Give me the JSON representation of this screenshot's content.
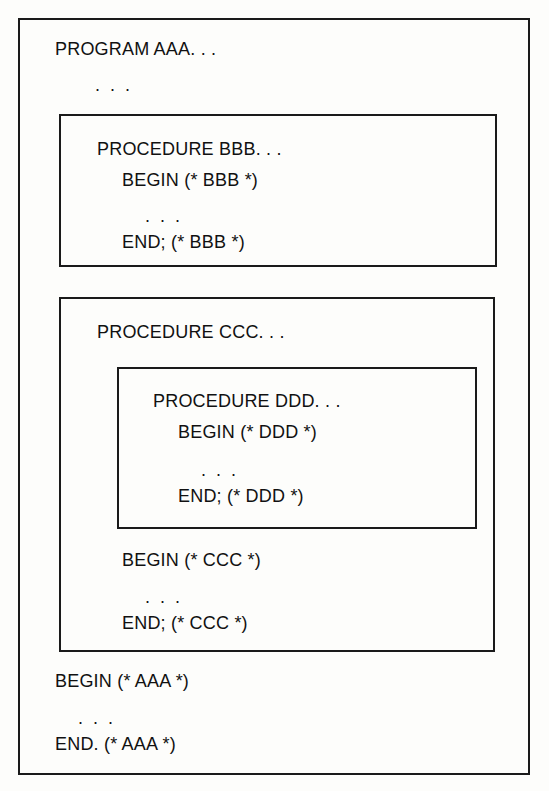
{
  "figure": {
    "background_color": "#fdfdfb",
    "ink_color": "#111111",
    "border_color": "#1a1a1a"
  },
  "program": {
    "name": "AAA",
    "header": "PROGRAM AAA. . .",
    "body_ellipsis": ". . .",
    "begin": "BEGIN (* AAA *)",
    "inner_ellipsis": ". . .",
    "end": "END. (* AAA *)"
  },
  "procedures": [
    {
      "name": "BBB",
      "header": "PROCEDURE BBB. . .",
      "begin": "BEGIN (* BBB *)",
      "inner_ellipsis": ". . .",
      "end": "END; (* BBB *)"
    },
    {
      "name": "CCC",
      "header": "PROCEDURE CCC. . .",
      "begin": "BEGIN (* CCC *)",
      "inner_ellipsis": ". . .",
      "end": "END; (* CCC *)"
    },
    {
      "name": "DDD",
      "header": "PROCEDURE DDD. . .",
      "begin": "BEGIN (* DDD *)",
      "inner_ellipsis": ". . .",
      "end": "END; (* DDD *)"
    }
  ]
}
